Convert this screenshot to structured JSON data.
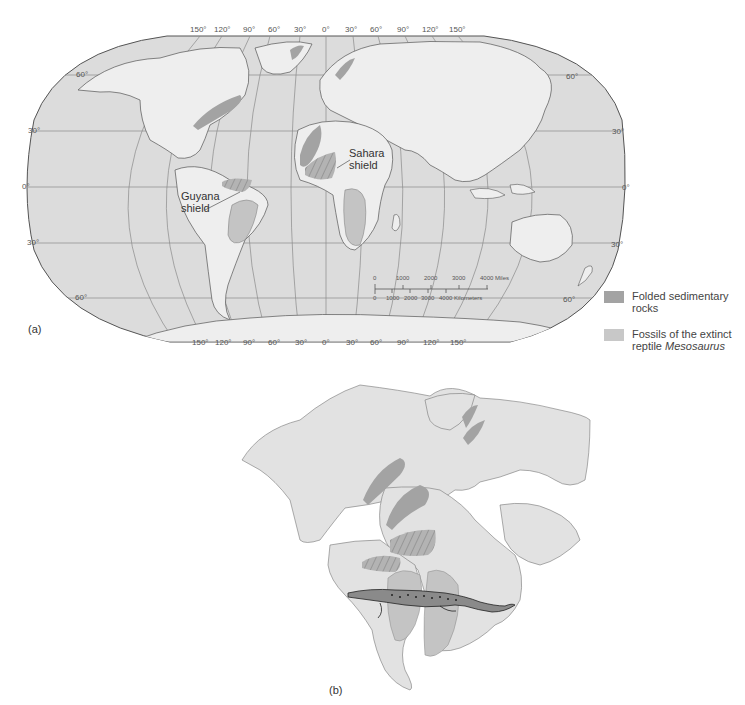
{
  "figure_a": {
    "panel_label": "(a)",
    "top_longitude_labels": [
      "150°",
      "120°",
      "90°",
      "60°",
      "30°",
      "0°",
      "30°",
      "60°",
      "90°",
      "120°",
      "150°"
    ],
    "bottom_longitude_labels": [
      "150°",
      "120°",
      "90°",
      "60°",
      "30°",
      "0°",
      "30°",
      "60°",
      "90°",
      "120°",
      "150°"
    ],
    "left_latitude_labels": [
      "60°",
      "30°",
      "0°",
      "30°",
      "60°"
    ],
    "right_latitude_labels": [
      "60°",
      "30°",
      "0°",
      "30°",
      "60°"
    ],
    "annotations": {
      "sahara": [
        "Sahara",
        "shield"
      ],
      "guyana": [
        "Guyana",
        "shield"
      ]
    },
    "scale_bar": {
      "miles_ticks": [
        "0",
        "1000",
        "2000",
        "3000",
        "4000 Miles"
      ],
      "km_ticks": [
        "0",
        "1000",
        "2000",
        "3000",
        "4000 Kilometers"
      ]
    }
  },
  "legend": {
    "items": [
      {
        "line1": "Folded sedimentary",
        "line2": "rocks",
        "color": "#a3a3a3"
      },
      {
        "line1": "Fossils of the extinct",
        "line2_prefix": "reptile ",
        "line2_italic": "Mesosaurus",
        "color": "#c8c8c8"
      }
    ]
  },
  "figure_b": {
    "panel_label": "(b)"
  },
  "colors": {
    "ocean": "#dcdcdc",
    "land": "#eeeeee",
    "folded": "#a3a3a3",
    "fossil": "#c4c4c4",
    "grid": "#8a8a8a",
    "outline": "#555555"
  }
}
